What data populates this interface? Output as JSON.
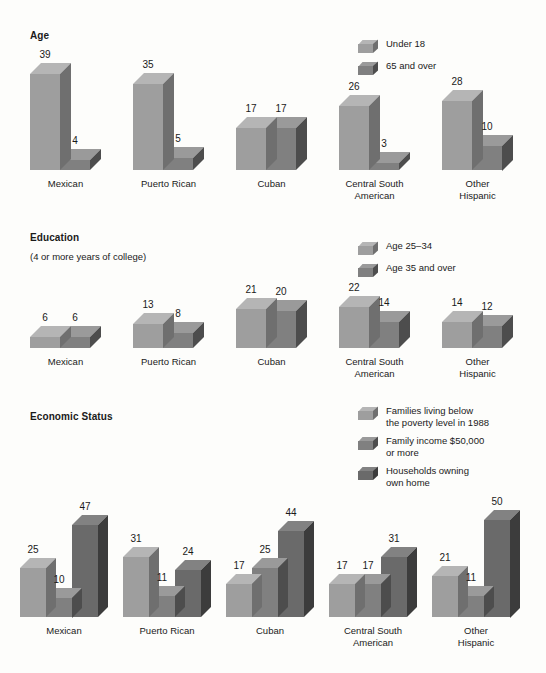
{
  "document": {
    "background_color": "#fdfdfb",
    "style": "scanned grayscale 3-D bar charts"
  },
  "palette": {
    "series1_front": "#9e9e9e",
    "series1_top": "#b5b5b5",
    "series1_side": "#6f6f6f",
    "series2_front": "#808080",
    "series2_top": "#9a9a9a",
    "series2_side": "#4d4d4d",
    "series3_front": "#6a6a6a",
    "series3_top": "#828282",
    "series3_side": "#3c3c3c"
  },
  "sections": [
    {
      "id": "age",
      "title": "Age",
      "subtitle": "",
      "legend": [
        {
          "label": "Under 18",
          "series": 1
        },
        {
          "label": "65 and over",
          "series": 2
        }
      ]
    },
    {
      "id": "education",
      "title": "Education",
      "subtitle": "(4 or more years of college)",
      "legend": [
        {
          "label": "Age 25–34",
          "series": 1
        },
        {
          "label": "Age 35 and over",
          "series": 2
        }
      ]
    },
    {
      "id": "economic",
      "title": "Economic Status",
      "subtitle": "",
      "legend": [
        {
          "label": "Families living below\nthe poverty level in 1988",
          "series": 1
        },
        {
          "label": "Family income $50,000\nor more",
          "series": 2
        },
        {
          "label": "Households owning\nown home",
          "series": 3
        }
      ]
    }
  ],
  "chart_data": [
    {
      "type": "bar",
      "title": "Age",
      "subtitle": "",
      "xlabel": "",
      "ylabel": "",
      "ylim": [
        0,
        39
      ],
      "grid": false,
      "legend_position": "top-right",
      "categories": [
        "Mexican",
        "Puerto Rican",
        "Cuban",
        "Central South\nAmerican",
        "Other\nHispanic"
      ],
      "series": [
        {
          "name": "Under 18",
          "values": [
            39,
            35,
            17,
            26,
            28
          ]
        },
        {
          "name": "65 and over",
          "values": [
            4,
            5,
            17,
            3,
            10
          ]
        }
      ]
    },
    {
      "type": "bar",
      "title": "Education",
      "subtitle": "(4 or more years of college)",
      "xlabel": "",
      "ylabel": "",
      "ylim": [
        0,
        22
      ],
      "grid": false,
      "legend_position": "top-right",
      "categories": [
        "Mexican",
        "Puerto Rican",
        "Cuban",
        "Central South\nAmerican",
        "Other\nHispanic"
      ],
      "series": [
        {
          "name": "Age 25–34",
          "values": [
            6,
            13,
            21,
            22,
            14
          ]
        },
        {
          "name": "Age 35 and over",
          "values": [
            6,
            8,
            20,
            14,
            12
          ]
        }
      ]
    },
    {
      "type": "bar",
      "title": "Economic Status",
      "subtitle": "",
      "xlabel": "",
      "ylabel": "",
      "ylim": [
        0,
        50
      ],
      "grid": false,
      "legend_position": "top-right",
      "categories": [
        "Mexican",
        "Puerto Rican",
        "Cuban",
        "Central South\nAmerican",
        "Other\nHispanic"
      ],
      "series": [
        {
          "name": "Families living below the poverty level in 1988",
          "values": [
            25,
            31,
            17,
            17,
            21
          ]
        },
        {
          "name": "Family income $50,000 or more",
          "values": [
            10,
            11,
            25,
            17,
            11
          ]
        },
        {
          "name": "Households owning own home",
          "values": [
            47,
            24,
            44,
            31,
            50
          ]
        }
      ]
    }
  ]
}
